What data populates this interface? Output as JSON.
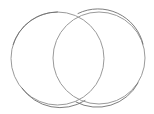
{
  "figure": {
    "title": "",
    "type": "venn-two-circle-outline",
    "background_color": "#ffffff",
    "stroke_color": "#9a9a9a",
    "stroke_color_dark": "#6e6e6e",
    "stroke_width": 1,
    "fill": "none",
    "labels": [],
    "annotations": []
  },
  "chart_data": {
    "type": "diagram",
    "subtype": "venn",
    "title": "",
    "xlabel": "",
    "ylabel": "",
    "grid": false,
    "legend": "none",
    "canvas": {
      "width": 154,
      "height": 114
    },
    "sets": [
      {
        "name": "left-circle",
        "cx": 57.5,
        "cy": 58.5,
        "r": 46.5,
        "label": "",
        "stroke": "#9a9a9a",
        "fill": "none"
      },
      {
        "name": "right-circle",
        "cx": 99.0,
        "cy": 58.0,
        "r": 46.0,
        "label": "",
        "stroke": "#9a9a9a",
        "fill": "none"
      }
    ],
    "intersection_points": [
      {
        "x": 82,
        "y": 14
      },
      {
        "x": 80,
        "y": 99
      }
    ],
    "extents": {
      "left_circle_x": [
        11,
        104
      ],
      "right_circle_x": [
        53,
        145
      ],
      "left_circle_y": [
        12,
        105
      ],
      "right_circle_y": [
        12,
        104
      ]
    }
  }
}
